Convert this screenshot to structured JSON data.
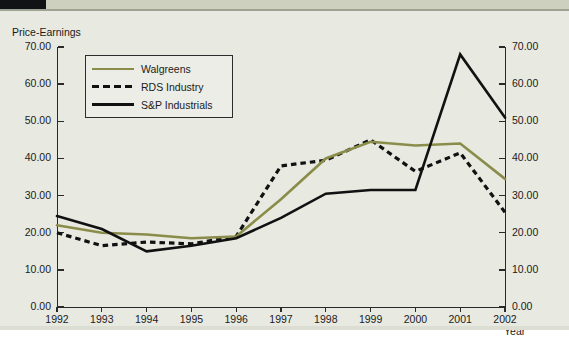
{
  "document": {
    "background_color": "#e8e9e1",
    "header_strip_color": "#cdd0bf",
    "header_block_color": "#111216"
  },
  "chart_data": {
    "type": "line",
    "title": "",
    "ylabel": "Price-Earnings",
    "xlabel": "Year",
    "grid": false,
    "legend_position": "top-left-inside",
    "ylim": [
      0,
      70
    ],
    "ytick_step": 10,
    "yticks": [
      "0.00",
      "10.00",
      "20.00",
      "30.00",
      "40.00",
      "50.00",
      "60.00",
      "70.00"
    ],
    "ytick_values": [
      0,
      10,
      20,
      30,
      40,
      50,
      60,
      70
    ],
    "right_axis_mirrored": true,
    "right_yticks": [
      "0.00",
      "10.00",
      "20.00",
      "30.00",
      "40.00",
      "50.00",
      "60.00",
      "70.00"
    ],
    "categories": [
      "1992",
      "1993",
      "1994",
      "1995",
      "1996",
      "1997",
      "1998",
      "1999",
      "2000",
      "2001",
      "2002"
    ],
    "x": [
      1992,
      1993,
      1994,
      1995,
      1996,
      1997,
      1998,
      1999,
      2000,
      2001,
      2002
    ],
    "series": [
      {
        "name": "Walgreens",
        "color": "#8a8d4a",
        "style": "solid",
        "values": [
          22.0,
          20.0,
          19.5,
          18.5,
          19.0,
          29.0,
          40.0,
          44.5,
          43.5,
          44.0,
          34.5
        ]
      },
      {
        "name": "RDS Industry",
        "color": "#111111",
        "style": "dashed",
        "values": [
          20.0,
          16.5,
          17.5,
          17.0,
          19.0,
          38.0,
          39.5,
          45.0,
          36.5,
          41.5,
          25.5
        ]
      },
      {
        "name": "S&P Industrials",
        "color": "#111111",
        "style": "solid",
        "values": [
          24.5,
          21.0,
          15.0,
          16.5,
          18.5,
          24.0,
          30.5,
          31.5,
          31.5,
          68.0,
          51.0
        ]
      }
    ]
  },
  "legend": {
    "items": [
      {
        "label": "Walgreens",
        "swatch": "solid-olive"
      },
      {
        "label": "RDS Industry",
        "swatch": "dashed-black"
      },
      {
        "label": "S&P Industrials",
        "swatch": "solid-black"
      }
    ]
  }
}
